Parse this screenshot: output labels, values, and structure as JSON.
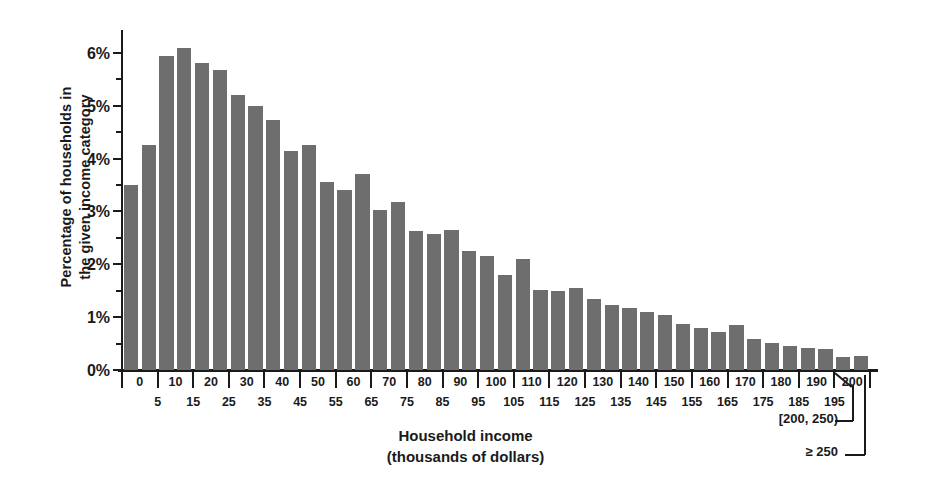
{
  "chart_data": {
    "type": "bar",
    "title": "",
    "xlabel": "Household income\n(thousands of dollars)",
    "ylabel": "Percentage of households in\nthe given income category",
    "ylim": [
      0,
      6.3
    ],
    "ytick_labels": [
      "0%",
      "1%",
      "2%",
      "3%",
      "4%",
      "5%",
      "6%"
    ],
    "ytick_values": [
      0,
      1,
      2,
      3,
      4,
      5,
      6
    ],
    "yminor_values": [
      0.5,
      1.5,
      2.5,
      3.5,
      4.5,
      5.5
    ],
    "grid": false,
    "legend": "none",
    "xtick_upper": [
      "0",
      "10",
      "20",
      "30",
      "40",
      "50",
      "60",
      "70",
      "80",
      "90",
      "100",
      "110",
      "120",
      "130",
      "140",
      "150",
      "160",
      "170",
      "180",
      "190",
      "200"
    ],
    "xtick_lower": [
      "5",
      "15",
      "25",
      "35",
      "45",
      "55",
      "65",
      "75",
      "85",
      "95",
      "105",
      "115",
      "125",
      "135",
      "145",
      "155",
      "165",
      "175",
      "185",
      "195"
    ],
    "categories": [
      "[0, 5)",
      "[5, 10)",
      "[10, 15)",
      "[15, 20)",
      "[20, 25)",
      "[25, 30)",
      "[30, 35)",
      "[35, 40)",
      "[40, 45)",
      "[45, 50)",
      "[50, 55)",
      "[55, 60)",
      "[60, 65)",
      "[65, 70)",
      "[70, 75)",
      "[75, 80)",
      "[80, 85)",
      "[85, 90)",
      "[90, 95)",
      "[95, 100)",
      "[100, 105)",
      "[105, 110)",
      "[110, 115)",
      "[115, 120)",
      "[120, 125)",
      "[125, 130)",
      "[130, 135)",
      "[135, 140)",
      "[140, 145)",
      "[145, 150)",
      "[150, 155)",
      "[155, 160)",
      "[160, 165)",
      "[165, 170)",
      "[170, 175)",
      "[175, 180)",
      "[180, 185)",
      "[185, 190)",
      "[190, 195)",
      "[195, 200)",
      "[200, 250)",
      ">= 250"
    ],
    "values": [
      3.5,
      4.25,
      5.95,
      6.1,
      5.8,
      5.68,
      5.2,
      5.0,
      4.73,
      4.15,
      4.25,
      3.55,
      3.4,
      3.7,
      3.02,
      3.18,
      2.63,
      2.57,
      2.65,
      2.25,
      2.15,
      1.8,
      2.1,
      1.52,
      1.5,
      1.55,
      1.35,
      1.23,
      1.18,
      1.1,
      1.05,
      0.88,
      0.8,
      0.72,
      0.85,
      0.58,
      0.52,
      0.45,
      0.42,
      0.4,
      0.25,
      0.27
    ],
    "extra_bar_values": [
      0.2,
      1.78,
      2.08
    ],
    "annotations": [
      {
        "label": "[200, 250)",
        "target": "second-to-last-bar"
      },
      {
        "label": "≥ 250",
        "target": "last-bar"
      }
    ],
    "bar_color": "#6e6e6e",
    "axis_color": "#1a1a1a"
  }
}
